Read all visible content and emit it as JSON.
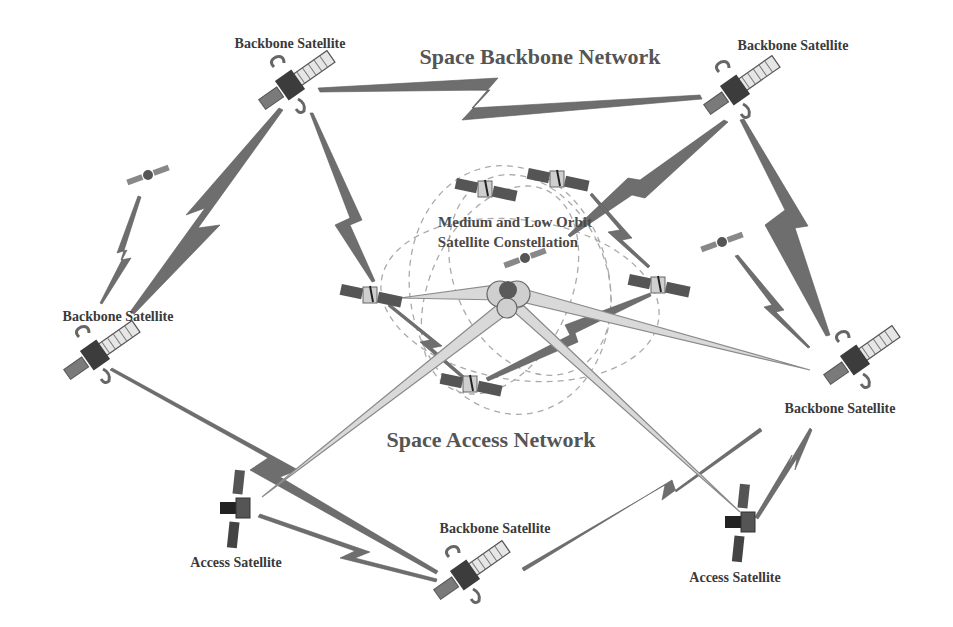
{
  "diagram": {
    "titles": {
      "backbone_network": "Space Backbone Network",
      "access_network": "Space Access Network",
      "constellation_line1": "Medium and Low Orbit",
      "constellation_line2": "Satellite Constellation"
    },
    "satellite_labels": {
      "backbone_top_left": "Backbone Satellite",
      "backbone_top_right": "Backbone Satellite",
      "backbone_left": "Backbone Satellite",
      "backbone_right": "Backbone Satellite",
      "backbone_bottom": "Backbone Satellite",
      "access_left": "Access Satellite",
      "access_right": "Access Satellite"
    },
    "nodes": [
      {
        "id": "backbone_top_left",
        "type": "backbone",
        "x": 290,
        "y": 85
      },
      {
        "id": "backbone_top_right",
        "type": "backbone",
        "x": 735,
        "y": 90
      },
      {
        "id": "backbone_left",
        "type": "backbone",
        "x": 95,
        "y": 355
      },
      {
        "id": "backbone_right",
        "type": "backbone",
        "x": 855,
        "y": 360
      },
      {
        "id": "backbone_bottom",
        "type": "backbone",
        "x": 465,
        "y": 575
      },
      {
        "id": "access_left",
        "type": "access",
        "x": 236,
        "y": 508
      },
      {
        "id": "access_right",
        "type": "access",
        "x": 741,
        "y": 522
      },
      {
        "id": "constellation_1",
        "type": "leo",
        "x": 485,
        "y": 190
      },
      {
        "id": "constellation_2",
        "type": "leo",
        "x": 557,
        "y": 180
      },
      {
        "id": "constellation_3",
        "type": "leo",
        "x": 370,
        "y": 296
      },
      {
        "id": "constellation_4",
        "type": "leo",
        "x": 658,
        "y": 286
      },
      {
        "id": "constellation_5",
        "type": "leo",
        "x": 470,
        "y": 385
      },
      {
        "id": "small_sat_top_left",
        "type": "small",
        "x": 148,
        "y": 175
      },
      {
        "id": "small_sat_right",
        "type": "small",
        "x": 722,
        "y": 242
      },
      {
        "id": "globe",
        "type": "earth",
        "x": 507,
        "y": 298
      }
    ],
    "colors": {
      "link": "#6e6e6e",
      "beam_fill": "#d9d9d9",
      "beam_stroke": "#8a8a8a",
      "orbit": "#aaaaaa",
      "text": "#3a3a3a"
    }
  }
}
